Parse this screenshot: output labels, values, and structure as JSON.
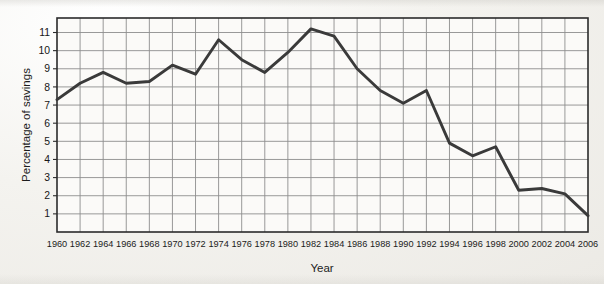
{
  "figure": {
    "background_color": "#f2f1ed",
    "plot_background_color": "#fbfaf8",
    "grid_color": "#8d8d8d",
    "axis_color": "#2b2b2b",
    "line_color": "#3a3a3a"
  },
  "chart_data": {
    "type": "line",
    "title": "",
    "xlabel": "Year",
    "ylabel": "Percentage of savings",
    "xlim": [
      1960,
      2006
    ],
    "ylim": [
      0,
      11.8
    ],
    "grid": true,
    "legend": "none",
    "x": [
      1960,
      1962,
      1964,
      1966,
      1968,
      1970,
      1972,
      1974,
      1976,
      1978,
      1980,
      1982,
      1984,
      1986,
      1988,
      1990,
      1992,
      1994,
      1996,
      1998,
      2000,
      2002,
      2004,
      2006
    ],
    "xtick_labels": [
      "1960",
      "1962",
      "1964",
      "1966",
      "1968",
      "1970",
      "1972",
      "1974",
      "1976",
      "1978",
      "1980",
      "1982",
      "1984",
      "1986",
      "1988",
      "1990",
      "1992",
      "1994",
      "1996",
      "1998",
      "2000",
      "2002",
      "2004",
      "2006"
    ],
    "ytick_labels": [
      "1",
      "2",
      "3",
      "4",
      "5",
      "6",
      "7",
      "8",
      "9",
      "10",
      "11"
    ],
    "ytick_values": [
      1,
      2,
      3,
      4,
      5,
      6,
      7,
      8,
      9,
      10,
      11
    ],
    "series": [
      {
        "name": "Percentage of savings",
        "values": [
          7.3,
          8.2,
          8.8,
          8.2,
          8.3,
          9.2,
          8.7,
          10.6,
          9.5,
          8.8,
          9.9,
          11.2,
          10.8,
          9.0,
          7.8,
          7.1,
          7.8,
          4.9,
          4.2,
          4.7,
          2.3,
          2.4,
          2.1,
          0.9
        ]
      }
    ]
  }
}
